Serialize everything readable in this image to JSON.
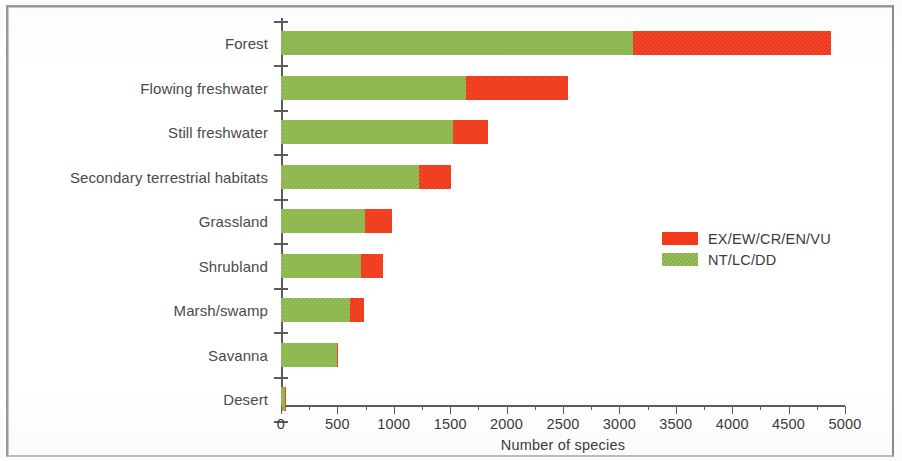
{
  "chart_data": {
    "type": "bar",
    "orientation": "horizontal",
    "stacked": true,
    "title": "",
    "xlabel": "Number of species",
    "ylabel": "",
    "xlim": [
      0,
      5000
    ],
    "ylim": null,
    "grid": false,
    "legend_position": "center-right",
    "categories": [
      "Forest",
      "Flowing freshwater",
      "Still freshwater",
      "Secondary terrestrial habitats",
      "Grassland",
      "Shrubland",
      "Marsh/swamp",
      "Savanna",
      "Desert"
    ],
    "series": [
      {
        "name": "NT/LC/DD",
        "color": "#8cb84a",
        "values": [
          3120,
          1640,
          1525,
          1225,
          745,
          710,
          610,
          495,
          35
        ]
      },
      {
        "name": "EX/EW/CR/EN/VU",
        "color": "#f4391a",
        "values": [
          1760,
          905,
          310,
          285,
          240,
          195,
          125,
          10,
          5
        ]
      }
    ],
    "totals": [
      4880,
      2545,
      1835,
      1510,
      985,
      905,
      735,
      505,
      40
    ],
    "xticks": [
      0,
      500,
      1000,
      1500,
      2000,
      2500,
      3000,
      3500,
      4000,
      4500,
      5000
    ],
    "xticklabels": [
      "0",
      "500",
      "1000",
      "1500",
      "2000",
      "2500",
      "3000",
      "3500",
      "4000",
      "4500",
      "5000"
    ],
    "x_minor_tick_step": 250
  },
  "legend": {
    "entries": [
      {
        "label": "EX/EW/CR/EN/VU",
        "color": "#f4391a"
      },
      {
        "label": "NT/LC/DD",
        "color": "#8cb84a"
      }
    ]
  },
  "axis": {
    "x_title": "Number of species"
  },
  "colors": {
    "threatened": "#f4391a",
    "not_threatened": "#8cb84a",
    "axis": "#5c5c5c",
    "text": "#3b3b3b",
    "frame": "#9a9a9a",
    "background": "#ffffff"
  }
}
